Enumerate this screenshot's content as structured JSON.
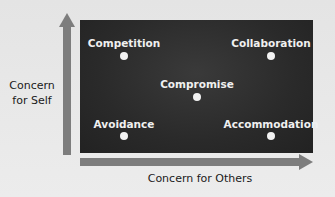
{
  "diagram": {
    "y_axis_label": "Concern for Self",
    "x_axis_label": "Concern for Others",
    "styles": [
      {
        "label": "Competition",
        "label_x": 124,
        "label_y": 37,
        "dot_x": 124,
        "dot_y": 56
      },
      {
        "label": "Collaboration",
        "label_x": 271,
        "label_y": 37,
        "dot_x": 271,
        "dot_y": 56
      },
      {
        "label": "Compromise",
        "label_x": 197,
        "label_y": 78,
        "dot_x": 197,
        "dot_y": 97
      },
      {
        "label": "Avoidance",
        "label_x": 124,
        "label_y": 118,
        "dot_x": 124,
        "dot_y": 136
      },
      {
        "label": "Accommodation",
        "label_x": 271,
        "label_y": 118,
        "dot_x": 271,
        "dot_y": 136
      }
    ],
    "colors": {
      "box": "#2a2a2a",
      "arrow": "#7d7d7d",
      "dot": "#f2f2f2",
      "label_on_box": "#f0f0f0",
      "axis_text": "#1a1a1a"
    }
  }
}
